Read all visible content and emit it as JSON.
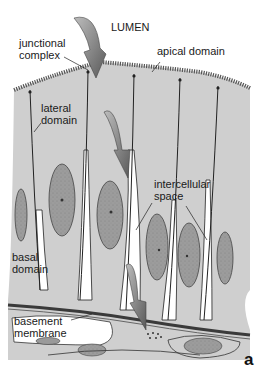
{
  "figure": {
    "panel_letter": "a",
    "labels": {
      "lumen": "LUMEN",
      "junctional_complex": "junctional\ncomplex",
      "apical_domain": "apical domain",
      "lateral_domain": "lateral\ndomain",
      "intercellular_space": "intercellular\nspace",
      "basal_domain": "basal\ndomain",
      "basement_membrane": "basement\nmembrane"
    },
    "colors": {
      "cytoplasm": "#cfcfcf",
      "nucleus": "#9a9a9a",
      "membrane": "#2a2a2a",
      "arrow": "#7a7a7a",
      "background": "#ffffff",
      "intercellular": "#ffffff"
    }
  }
}
